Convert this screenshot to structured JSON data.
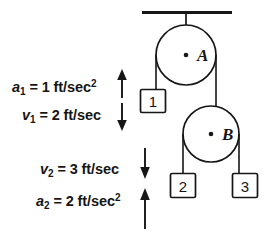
{
  "figure": {
    "stroke_color": "#161616",
    "fill_color": "#ffffff",
    "background": "#ffffff"
  },
  "support": {
    "name": "ceiling",
    "label": ""
  },
  "pulleys": [
    {
      "id": "A",
      "label": "A",
      "cx": 186,
      "cy": 55,
      "r": 30
    },
    {
      "id": "B",
      "label": "B",
      "cx": 211,
      "cy": 134,
      "r": 28
    }
  ],
  "blocks": [
    {
      "id": "1",
      "label": "1"
    },
    {
      "id": "2",
      "label": "2"
    },
    {
      "id": "3",
      "label": "3"
    }
  ],
  "annotations": [
    {
      "id": "a1",
      "symbol": "a",
      "subscript": "1",
      "equals": "=",
      "value": "1",
      "unit": "ft/sec",
      "exponent": "2",
      "full_text": "a1 = 1 ft/sec2",
      "arrow_direction": "up"
    },
    {
      "id": "v1",
      "symbol": "v",
      "subscript": "1",
      "equals": "=",
      "value": "2",
      "unit": "ft/sec",
      "exponent": "",
      "full_text": "v1 = 2 ft/sec",
      "arrow_direction": "down"
    },
    {
      "id": "v2",
      "symbol": "v",
      "subscript": "2",
      "equals": "=",
      "value": "3",
      "unit": "ft/sec",
      "exponent": "",
      "full_text": "v2 = 3 ft/sec",
      "arrow_direction": "down"
    },
    {
      "id": "a2",
      "symbol": "a",
      "subscript": "2",
      "equals": "=",
      "value": "2",
      "unit": "ft/sec",
      "exponent": "2",
      "full_text": "a2 = 2 ft/sec2",
      "arrow_direction": "up"
    }
  ]
}
